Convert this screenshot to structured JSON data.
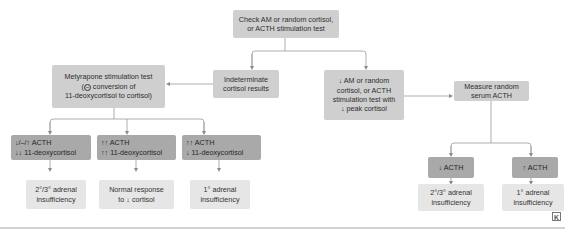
{
  "flowchart": {
    "start": {
      "line1": "Check AM or random cortisol,",
      "line2": "or ACTH stimulation test"
    },
    "indeterminate": {
      "line1": "Indeterminate",
      "line2": "cortisol results"
    },
    "metyrapone": {
      "line1": "Metyrapone stimulation test",
      "line2_prefix": "(",
      "line2_icon": "inhibit-icon",
      "line2_symbol": "−",
      "line2_rest": " conversion of",
      "line3": "11-deoxycortisol to cortisol)"
    },
    "low_cortisol": {
      "line1": "↓ AM or random",
      "line2": "cortisol, or ACTH",
      "line3": "stimulation test with",
      "line4": "↓ peak cortisol"
    },
    "measure_acth": {
      "line1": "Measure random",
      "line2": "serum ACTH"
    },
    "metyrapone_results": [
      {
        "acth": "↓/–/↑ ACTH",
        "deoxy": "↓↓ 11-deoxycortisol",
        "outcome1": "2°/3° adrenal",
        "outcome2": "insufficiency"
      },
      {
        "acth": "↑↑ ACTH",
        "deoxy": "↑↑ 11-deoxycortisol",
        "outcome1": "Normal response",
        "outcome2": "to ↓ cortisol"
      },
      {
        "acth": "↑↑ ACTH",
        "deoxy": "↓ 11-deoxycortisol",
        "outcome1": "1° adrenal",
        "outcome2": "insufficiency"
      }
    ],
    "acth_results": [
      {
        "acth": "↓ ACTH",
        "outcome1": "2°/3° adrenal",
        "outcome2": "insufficiency"
      },
      {
        "acth": "↑ ACTH",
        "outcome1": "1° adrenal",
        "outcome2": "insufficiency"
      }
    ]
  },
  "footer": {
    "logo_icon": "publisher-logo-icon",
    "logo_text": "K"
  },
  "colors": {
    "mid_box": "#cfcfcf",
    "dark_box": "#a9a9a9",
    "light_box": "#e6e6e6",
    "line": "#9a9a9a"
  }
}
